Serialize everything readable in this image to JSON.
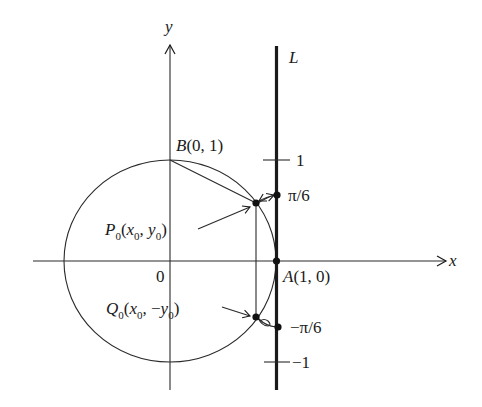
{
  "diagram": {
    "title": "",
    "axes": {
      "x_label": "x",
      "y_label": "y",
      "origin_label": "0"
    },
    "line": {
      "name": "L",
      "tick_labels": {
        "plus_one": "1",
        "minus_one": "−1"
      }
    },
    "points": {
      "B": {
        "name": "B",
        "coords": "(0, 1)"
      },
      "A": {
        "name": "A",
        "coords": "(1, 0)"
      },
      "P0": {
        "name": "P",
        "sub": "0",
        "open": "(",
        "x": "x",
        "x_sub": "0",
        "sep": ", ",
        "y": "y",
        "y_sub": "0",
        "close": ")"
      },
      "Q0": {
        "name": "Q",
        "sub": "0",
        "open": "(",
        "x": "x",
        "x_sub": "0",
        "sep": ", −",
        "y": "y",
        "y_sub": "0",
        "close": ")"
      }
    },
    "arc_labels": {
      "upper": "π/6",
      "lower": "−π/6"
    },
    "colors": {
      "ink": "#1a1a1a",
      "background": "#ffffff"
    }
  }
}
